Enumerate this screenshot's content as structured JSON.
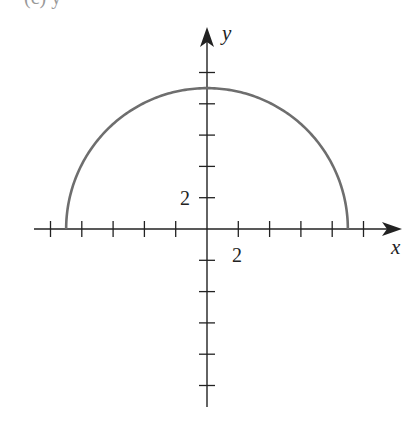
{
  "chart_data": {
    "type": "line",
    "title": "(c) y =",
    "xlabel": "x",
    "ylabel": "y",
    "equation": "y = sqrt(81 - x^2)",
    "xlim": [
      -11,
      12
    ],
    "ylim": [
      -11,
      13
    ],
    "tick_spacing": 2,
    "x_ticks": [
      -10,
      -8,
      -6,
      -4,
      -2,
      2,
      4,
      6,
      8,
      10
    ],
    "y_ticks": [
      -10,
      -8,
      -6,
      -4,
      -2,
      2,
      4,
      6,
      8,
      10
    ],
    "x_tick_labels": [
      {
        "value": 2,
        "label": "2"
      }
    ],
    "y_tick_labels": [
      {
        "value": 2,
        "label": "2"
      }
    ],
    "series": [
      {
        "name": "semicircle",
        "color": "#6e6e6e",
        "x": [
          -9,
          -8,
          -6,
          -4,
          -2,
          0,
          2,
          4,
          6,
          8,
          9
        ],
        "y": [
          0,
          4.12,
          6.71,
          8.06,
          8.77,
          9,
          8.77,
          8.06,
          6.71,
          4.12,
          0
        ]
      }
    ],
    "grid": false,
    "legend": null
  },
  "labels": {
    "title_clipped": "(c) y =",
    "x_axis": "x",
    "y_axis": "y",
    "x_tick_2": "2",
    "y_tick_2": "2"
  },
  "colors": {
    "axis": "#222222",
    "curve": "#6e6e6e",
    "background": "#ffffff"
  }
}
